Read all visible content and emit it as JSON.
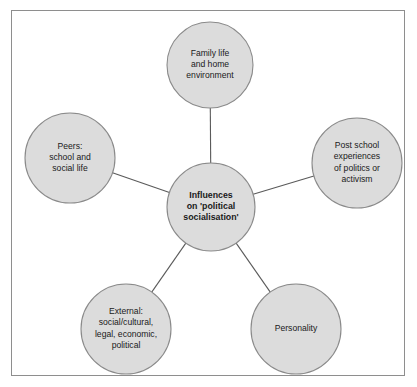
{
  "diagram": {
    "type": "hub-and-spoke-circle-diagram",
    "frame": {
      "border_color": "#8e8e8e",
      "background": "#ffffff"
    },
    "style": {
      "node_fill": "#dcdcdc",
      "node_stroke": "#8a8a8a",
      "connector_color": "#5a5a5a",
      "text_color": "#1a1a1a"
    },
    "center": {
      "id": "center-node",
      "label": "Influences on 'political socialisation'",
      "lines": [
        "Influences",
        "on 'political",
        "socialisation'"
      ],
      "bold": true,
      "cx": 211,
      "cy": 207,
      "r": 44
    },
    "nodes": [
      {
        "id": "family-life-node",
        "label": "Family life and home environment",
        "lines": [
          "Family life",
          "and home",
          "environment"
        ],
        "cx": 210,
        "cy": 65,
        "r": 43
      },
      {
        "id": "post-school-node",
        "label": "Post school experiences of politics or activism",
        "lines": [
          "Post school",
          "experiences",
          "of politics or",
          "activism"
        ],
        "cx": 357,
        "cy": 163,
        "r": 45
      },
      {
        "id": "personality-node",
        "label": "Personality",
        "lines": [
          "Personality"
        ],
        "cx": 296,
        "cy": 329,
        "r": 45
      },
      {
        "id": "external-node",
        "label": "External: social/cultural, legal, economic, political",
        "lines": [
          "External:",
          "social/cultural,",
          "legal, economic,",
          "political"
        ],
        "cx": 126,
        "cy": 329,
        "r": 45
      },
      {
        "id": "peers-node",
        "label": "Peers: school and social life",
        "lines": [
          "Peers:",
          "school and",
          "social life"
        ],
        "cx": 70,
        "cy": 158,
        "r": 45
      }
    ],
    "connectors": [
      {
        "id": "connector-center-family",
        "from": "center-node",
        "to": "family-life-node"
      },
      {
        "id": "connector-center-post-school",
        "from": "center-node",
        "to": "post-school-node"
      },
      {
        "id": "connector-center-personality",
        "from": "center-node",
        "to": "personality-node"
      },
      {
        "id": "connector-center-external",
        "from": "center-node",
        "to": "external-node"
      },
      {
        "id": "connector-center-peers",
        "from": "center-node",
        "to": "peers-node"
      }
    ]
  }
}
